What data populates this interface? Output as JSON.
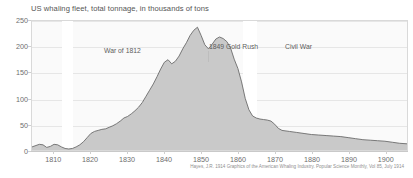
{
  "title": "US whaling fleet, total tonnage, in thousands of tons",
  "source": "Hayes, J.R. 1914 Graphics of the American Whaling Industry. Popular Science Monthly, Vol 85, July 1914",
  "annotations": [
    {
      "id": "war-of-1812",
      "label": "War of 1812"
    },
    {
      "id": "gold-rush",
      "label": "1849 Gold Rush"
    },
    {
      "id": "civil-war",
      "label": "Civil War"
    }
  ],
  "colors": {
    "area_fill": "#c9c9c9",
    "area_line": "#6b6b6b",
    "plot_background": "#fafafa",
    "band_highlight": "#ffffff",
    "gridline": "#e6e6e6",
    "text": "#5c5c5c",
    "axis_text": "#6e6e6e"
  },
  "chart_data": {
    "type": "area",
    "title": "US whaling fleet, total tonnage, in thousands of tons",
    "xlabel": "",
    "ylabel": "thousands of tons",
    "xlim": [
      1804,
      1906
    ],
    "ylim": [
      0,
      250
    ],
    "yticks": [
      0,
      50,
      100,
      150,
      200,
      250
    ],
    "xticks": [
      1800,
      1810,
      1820,
      1830,
      1840,
      1850,
      1860,
      1870,
      1880,
      1890,
      1900
    ],
    "grid": true,
    "legend": "none",
    "era_bands": [
      {
        "label": "War of 1812",
        "start": 1812,
        "end": 1815
      },
      {
        "label": "Civil War",
        "start": 1861,
        "end": 1865
      }
    ],
    "x": [
      1804,
      1806,
      1807,
      1808,
      1809,
      1810,
      1811,
      1812,
      1813,
      1814,
      1815,
      1816,
      1817,
      1818,
      1819,
      1820,
      1821,
      1822,
      1823,
      1824,
      1825,
      1826,
      1827,
      1828,
      1829,
      1830,
      1831,
      1832,
      1833,
      1834,
      1835,
      1836,
      1837,
      1838,
      1839,
      1840,
      1841,
      1842,
      1843,
      1844,
      1845,
      1846,
      1847,
      1848,
      1849,
      1850,
      1851,
      1852,
      1853,
      1854,
      1855,
      1856,
      1857,
      1858,
      1859,
      1860,
      1861,
      1862,
      1863,
      1864,
      1865,
      1866,
      1867,
      1868,
      1869,
      1870,
      1871,
      1872,
      1874,
      1876,
      1878,
      1880,
      1882,
      1884,
      1886,
      1888,
      1890,
      1892,
      1894,
      1896,
      1898,
      1900,
      1902,
      1904,
      1906
    ],
    "values": [
      6,
      11,
      10,
      5,
      7,
      11,
      10,
      6,
      3,
      2,
      3,
      6,
      10,
      16,
      24,
      32,
      36,
      38,
      40,
      41,
      44,
      47,
      51,
      56,
      62,
      65,
      70,
      76,
      83,
      92,
      104,
      116,
      128,
      142,
      157,
      170,
      175,
      167,
      172,
      182,
      196,
      208,
      222,
      232,
      238,
      222,
      204,
      196,
      205,
      215,
      219,
      216,
      210,
      198,
      176,
      158,
      132,
      100,
      78,
      66,
      62,
      60,
      59,
      58,
      56,
      50,
      42,
      38,
      36,
      34,
      32,
      30,
      29,
      28,
      27,
      26,
      24,
      22,
      20,
      19,
      18,
      17,
      15,
      13,
      12
    ]
  }
}
